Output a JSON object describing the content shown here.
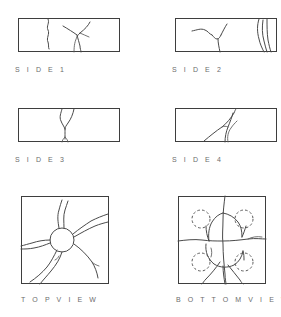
{
  "figure": {
    "background_color": "#ffffff",
    "line_color": "#4a4a4a",
    "frame_color": "#3e3e3e",
    "caption_color": "#6d6d6d"
  },
  "panels": [
    {
      "id": "side-1",
      "caption": "S I D E   1",
      "view_type": "side",
      "shape": "rectangle",
      "frame": {
        "x": 18,
        "y": 18,
        "width": 102,
        "height": 34
      },
      "caption_pos": {
        "x": 15,
        "y": 66
      },
      "features": {
        "cracks": 4,
        "dashed_circles": 0,
        "impact_circle": false,
        "description": "Branching vertical cracks with a Y-shaped fork near center-right and a wavy crack at left"
      }
    },
    {
      "id": "side-2",
      "caption": "S I D E   2",
      "view_type": "side",
      "shape": "rectangle",
      "frame": {
        "x": 175,
        "y": 18,
        "width": 102,
        "height": 34
      },
      "caption_pos": {
        "x": 172,
        "y": 66
      },
      "features": {
        "cracks": 5,
        "dashed_circles": 0,
        "impact_circle": false,
        "description": "Zig-zag branching crack at left-center and a bundle of three near-vertical cracks at right edge"
      }
    },
    {
      "id": "side-3",
      "caption": "S I D E   3",
      "view_type": "side",
      "shape": "rectangle",
      "frame": {
        "x": 18,
        "y": 108,
        "width": 102,
        "height": 34
      },
      "caption_pos": {
        "x": 15,
        "y": 156
      },
      "features": {
        "cracks": 3,
        "dashed_circles": 0,
        "impact_circle": false,
        "description": "Single hourglass-shaped crack crossing the full height at center, splitting at the bottom edge"
      }
    },
    {
      "id": "side-4",
      "caption": "S I D E   4",
      "view_type": "side",
      "shape": "rectangle",
      "frame": {
        "x": 175,
        "y": 108,
        "width": 102,
        "height": 34
      },
      "caption_pos": {
        "x": 172,
        "y": 156
      },
      "features": {
        "cracks": 3,
        "dashed_circles": 0,
        "impact_circle": false,
        "description": "Curved crack sweeping from lower-left up to the top edge with a parallel branch at center"
      }
    },
    {
      "id": "top-view",
      "caption": "T O P   V I E W",
      "view_type": "top",
      "shape": "square",
      "frame": {
        "x": 21,
        "y": 196,
        "width": 88,
        "height": 88
      },
      "caption_pos": {
        "x": 21,
        "y": 296
      },
      "features": {
        "cracks": 7,
        "dashed_circles": 0,
        "impact_circle": true,
        "impact_circle_center": {
          "x": 62,
          "y": 240
        },
        "impact_circle_radius": 12,
        "description": "Central impact circle with seven cracks radiating outward to the panel edges"
      }
    },
    {
      "id": "bottom-view",
      "caption": "B O T T O M   V I E W",
      "view_type": "bottom",
      "shape": "square",
      "frame": {
        "x": 178,
        "y": 196,
        "width": 88,
        "height": 88
      },
      "caption_pos": {
        "x": 176,
        "y": 296
      },
      "features": {
        "cracks": 9,
        "dashed_circles": 4,
        "impact_circle": false,
        "dashed_circle_radius": 9,
        "dashed_circle_centers": [
          {
            "x": 201,
            "y": 219
          },
          {
            "x": 244,
            "y": 219
          },
          {
            "x": 201,
            "y": 262
          },
          {
            "x": 244,
            "y": 262
          }
        ],
        "description": "Grid of intersecting cracks forming quadrants, with four dashed circles marking fastener locations"
      }
    }
  ]
}
